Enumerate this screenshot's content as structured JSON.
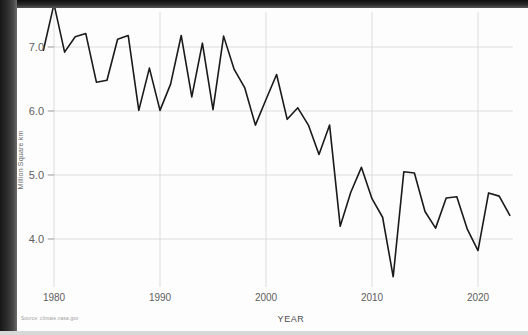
{
  "figure": {
    "source_note": "Source: climate.nasa.gov"
  },
  "chart_data": {
    "type": "line",
    "title": "",
    "xlabel": "YEAR",
    "ylabel": "Million Square km",
    "xlim": [
      1978,
      2024
    ],
    "ylim": [
      3.2,
      7.9
    ],
    "xticks": [
      1980,
      1990,
      2000,
      2010,
      2020
    ],
    "xtick_labels": [
      "1980",
      "1990",
      "2000",
      "2010",
      "2020"
    ],
    "yticks": [
      4.0,
      5.0,
      6.0,
      7.0
    ],
    "ytick_labels": [
      "4.0",
      "5.0",
      "6.0",
      "7.0"
    ],
    "grid": true,
    "legend": "none",
    "line_color": "#1a1a1a",
    "line_width": 1.6,
    "x": [
      1979,
      1980,
      1981,
      1982,
      1983,
      1984,
      1985,
      1986,
      1987,
      1988,
      1989,
      1990,
      1991,
      1992,
      1993,
      1994,
      1995,
      1996,
      1997,
      1998,
      1999,
      2000,
      2001,
      2002,
      2003,
      2004,
      2005,
      2006,
      2007,
      2008,
      2009,
      2010,
      2011,
      2012,
      2013,
      2014,
      2015,
      2016,
      2017,
      2018,
      2019,
      2020,
      2021,
      2022,
      2023
    ],
    "values": [
      6.95,
      7.67,
      6.92,
      7.16,
      7.21,
      6.45,
      6.48,
      7.12,
      7.18,
      6.01,
      6.67,
      6.01,
      6.42,
      7.18,
      6.22,
      7.06,
      6.02,
      7.17,
      6.65,
      6.36,
      5.78,
      6.18,
      6.57,
      5.87,
      6.05,
      5.78,
      5.32,
      5.78,
      4.2,
      4.73,
      5.12,
      4.63,
      4.34,
      3.41,
      5.05,
      5.03,
      4.43,
      4.17,
      4.64,
      4.66,
      4.15,
      3.82,
      4.72,
      4.67,
      4.37
    ]
  }
}
